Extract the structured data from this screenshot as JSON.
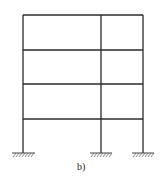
{
  "diagram": {
    "type": "frame-structure",
    "caption": "b)",
    "stories": 4,
    "bays": 2,
    "columns_x": [
      23,
      101,
      143
    ],
    "floor_levels_y": [
      15,
      50,
      84,
      119
    ],
    "base_y": 153,
    "supports": [
      {
        "type": "fixed",
        "x": 23
      },
      {
        "type": "fixed",
        "x": 101
      },
      {
        "type": "fixed",
        "x": 143
      }
    ],
    "colors": {
      "member": "#2a2a2a",
      "background": "#ffffff"
    }
  }
}
